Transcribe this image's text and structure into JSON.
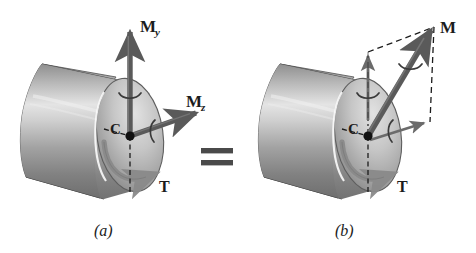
{
  "figure": {
    "type": "engineering-diagram",
    "background_color": "#ffffff",
    "ink_color": "#1c1c1c",
    "arrow_color": "#5a5a5a",
    "shaft_light": "#e8e8e8",
    "shaft_mid": "#b4b4b4",
    "shaft_dark": "#767676"
  },
  "equals_sign": {
    "symbol": "=",
    "name": "equals"
  },
  "panel_a": {
    "caption": "(a)",
    "centroid_label": "C",
    "labels": {
      "bending_moment_y": {
        "base": "M",
        "sub": "y"
      },
      "bending_moment_z": {
        "base": "M",
        "sub": "z"
      },
      "torque": "T"
    }
  },
  "panel_b": {
    "caption": "(b)",
    "centroid_label": "C",
    "labels": {
      "resultant_moment": {
        "base": "M",
        "sub": ""
      },
      "torque": "T"
    }
  }
}
